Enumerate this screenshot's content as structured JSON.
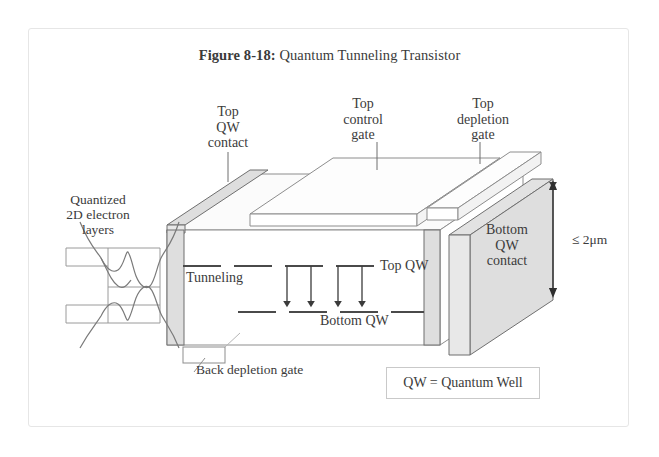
{
  "figure": {
    "caption_number": "Figure 8-18:",
    "caption_title": "Quantum Tunneling Transistor"
  },
  "labels": {
    "top_qw_contact": "Top\nQW\ncontact",
    "top_qw_contact_lines": [
      "Top",
      "QW",
      "contact"
    ],
    "top_control_gate_lines": [
      "Top",
      "control",
      "gate"
    ],
    "top_depletion_gate_lines": [
      "Top",
      "depletion",
      "gate"
    ],
    "quantized_layers_lines": [
      "Quantized",
      "2D electron",
      "layers"
    ],
    "bottom_qw_contact_lines": [
      "Bottom",
      "QW",
      "contact"
    ],
    "dimension": "≤ 2μm",
    "tunneling": "Tunneling",
    "top_qw": "Top QW",
    "bottom_qw": "Bottom QW",
    "back_depletion_gate": "Back depletion gate",
    "legend": "QW = Quantum Well"
  },
  "colors": {
    "stroke": "#555555",
    "line_light": "#9a9a9a",
    "face_front": "#ffffff",
    "face_top": "#fbfbfb",
    "face_shaded": "#dedede",
    "face_shaded_light": "#e8e8e8",
    "text": "#3b3b3b",
    "frame": "#e6e6e6",
    "qw_line": "#4a4a4a"
  },
  "diagram": {
    "type": "isometric-device-cross-section",
    "tunneling_arrow_count": 4,
    "electron_layer_count": 2,
    "top_gate_slab_count": 2
  }
}
